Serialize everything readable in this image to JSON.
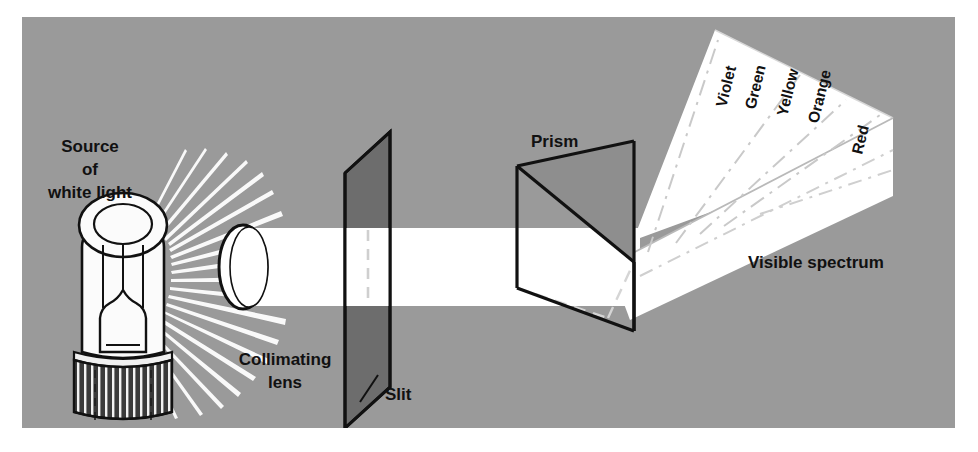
{
  "figure": {
    "background_color": "#ffffff",
    "panel_color": "#9a9a9a",
    "beam_color": "#ffffff",
    "ink_color": "#111111",
    "plate_color": "#6d6d6d",
    "prism_shade_color": "#8e8e8e",
    "base_color": "#3a3a3a"
  },
  "labels": {
    "source_line1": "Source",
    "source_line2": "of",
    "source_line3": "white light",
    "collimating_line1": "Collimating",
    "collimating_line2": "lens",
    "slit": "Slit",
    "prism": "Prism",
    "visible_spectrum": "Visible spectrum"
  },
  "spectrum": {
    "bands": [
      {
        "name": "Violet",
        "x": 726,
        "y": 108,
        "rotation": -76
      },
      {
        "name": "Green",
        "x": 755,
        "y": 110,
        "rotation": -76
      },
      {
        "name": "Yellow",
        "x": 787,
        "y": 117,
        "rotation": -76
      },
      {
        "name": "Orange",
        "x": 818,
        "y": 124,
        "rotation": -76
      },
      {
        "name": "Red",
        "x": 862,
        "y": 155,
        "rotation": -76
      }
    ]
  },
  "components": {
    "lamp": "incandescent-light-bulb",
    "lens": "collimating-lens",
    "plate": "slit-plate",
    "prism": "triangular-glass-prism",
    "fan": "dispersed-spectrum-fan"
  }
}
